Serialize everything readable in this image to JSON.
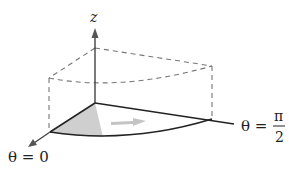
{
  "diagram": {
    "type": "cylindrical-wedge-region",
    "labels": {
      "z_axis": "z",
      "theta_start": "θ = 0",
      "theta_end_prefix": "θ =",
      "theta_end_num": "π",
      "theta_end_den": "2"
    },
    "colors": {
      "stroke": "#222222",
      "dashed": "#777777",
      "shade": "#cfcfcf",
      "arrow_fill": "#bdbdbd",
      "axis_arrow": "#666666"
    }
  }
}
